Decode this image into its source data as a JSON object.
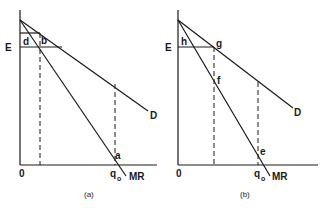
{
  "panels": [
    {
      "caption": "(a)",
      "labels": {
        "E": "E",
        "d": "d",
        "b": "b",
        "D": "D",
        "a": "a",
        "origin": "0",
        "q": "q",
        "q_sub": "o",
        "MR": "MR"
      }
    },
    {
      "caption": "(b)",
      "labels": {
        "E": "E",
        "h": "h",
        "g": "g",
        "f": "f",
        "D": "D",
        "e": "e",
        "origin": "0",
        "q": "q",
        "q_sub": "o",
        "MR": "MR"
      }
    }
  ]
}
